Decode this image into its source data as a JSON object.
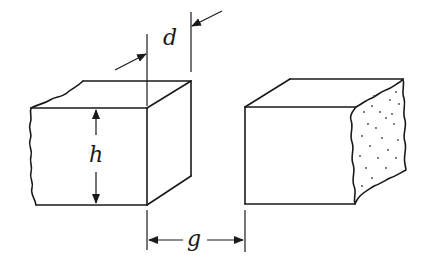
{
  "diagram": {
    "labels": {
      "depth": "d",
      "height": "h",
      "gap": "g"
    },
    "components": [
      {
        "name": "left-block",
        "description": "Rectangular block with wavy left (broken) edge"
      },
      {
        "name": "right-block",
        "description": "Rectangular block with stippled fractured right face"
      }
    ],
    "dimensions": [
      {
        "symbol": "d",
        "meaning": "block depth, shown by inward arrows between two extension lines at top"
      },
      {
        "symbol": "h",
        "meaning": "block height, shown by vertical double arrow on left block front face"
      },
      {
        "symbol": "g",
        "meaning": "gap between the blocks, shown by horizontal arrows at bottom"
      }
    ],
    "colors": {
      "ink": "#1a1a1a",
      "background": "#ffffff"
    }
  }
}
